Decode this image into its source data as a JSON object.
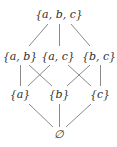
{
  "diagram": {
    "type": "hasse-diagram",
    "colors": {
      "background": "#ffffff",
      "text": "#2e2e2e",
      "edge": "#8a8a8a"
    },
    "nodes": [
      {
        "id": "abc",
        "label": "{a, b, c}",
        "x": 59,
        "y": 18
      },
      {
        "id": "ab",
        "label": "{a, b}",
        "x": 20,
        "y": 60
      },
      {
        "id": "ac",
        "label": "{a, c}",
        "x": 58,
        "y": 60
      },
      {
        "id": "bc",
        "label": "{b, c}",
        "x": 99,
        "y": 60
      },
      {
        "id": "a",
        "label": "{a}",
        "x": 20,
        "y": 98
      },
      {
        "id": "b",
        "label": "{b}",
        "x": 59,
        "y": 98
      },
      {
        "id": "c",
        "label": "{c}",
        "x": 100,
        "y": 98
      },
      {
        "id": "empty",
        "label": "∅",
        "x": 59,
        "y": 138
      }
    ],
    "edges": [
      {
        "from": "abc",
        "to": "ab",
        "x1": 48,
        "y1": 24,
        "x2": 29,
        "y2": 46
      },
      {
        "from": "abc",
        "to": "ac",
        "x1": 59.5,
        "y1": 24,
        "x2": 59.5,
        "y2": 46
      },
      {
        "from": "abc",
        "to": "bc",
        "x1": 71,
        "y1": 24,
        "x2": 90,
        "y2": 46
      },
      {
        "from": "ab",
        "to": "a",
        "x1": 20.5,
        "y1": 65,
        "x2": 20.5,
        "y2": 86
      },
      {
        "from": "ab",
        "to": "b",
        "x1": 29,
        "y1": 65,
        "x2": 52,
        "y2": 86
      },
      {
        "from": "ac",
        "to": "a",
        "x1": 50,
        "y1": 65,
        "x2": 28,
        "y2": 86
      },
      {
        "from": "ac",
        "to": "c",
        "x1": 68,
        "y1": 65,
        "x2": 91,
        "y2": 86
      },
      {
        "from": "bc",
        "to": "b",
        "x1": 90,
        "y1": 65,
        "x2": 67,
        "y2": 86
      },
      {
        "from": "bc",
        "to": "c",
        "x1": 100.5,
        "y1": 65,
        "x2": 100.5,
        "y2": 86
      },
      {
        "from": "a",
        "to": "empty",
        "x1": 29,
        "y1": 104,
        "x2": 53,
        "y2": 127
      },
      {
        "from": "b",
        "to": "empty",
        "x1": 59.5,
        "y1": 104,
        "x2": 59.5,
        "y2": 127
      },
      {
        "from": "c",
        "to": "empty",
        "x1": 91,
        "y1": 104,
        "x2": 66,
        "y2": 127
      }
    ]
  }
}
